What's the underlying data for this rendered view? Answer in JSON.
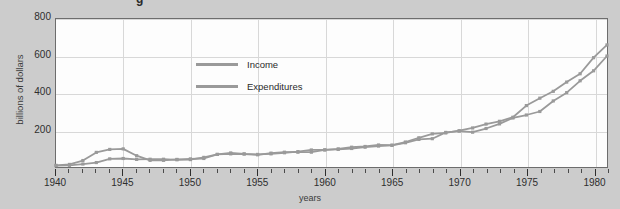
{
  "figure": {
    "title_fragment": "g",
    "background_color": "#cccccc",
    "plot_background_color": "#fdfdfd",
    "frame_color": "#6d6d6d",
    "grid_color": "#d8d8d8",
    "line_color": "#9a9a9a"
  },
  "legend": {
    "position": "inside-top-left",
    "entries": [
      {
        "label": "Income"
      },
      {
        "label": "Expenditures"
      }
    ]
  },
  "chart_data": {
    "type": "line",
    "title": "",
    "xlabel": "years",
    "ylabel": "billions of dollars",
    "xlim": [
      1940,
      1981
    ],
    "ylim": [
      0,
      800
    ],
    "yticks": [
      200,
      400,
      600,
      800
    ],
    "xticks_major": [
      1940,
      1945,
      1950,
      1955,
      1960,
      1965,
      1970,
      1975,
      1980
    ],
    "xtick_interval_minor": 1,
    "grid": true,
    "legend_position": "inside-top-left",
    "x": [
      1940,
      1941,
      1942,
      1943,
      1944,
      1945,
      1946,
      1947,
      1948,
      1949,
      1950,
      1951,
      1952,
      1953,
      1954,
      1955,
      1956,
      1957,
      1958,
      1959,
      1960,
      1961,
      1962,
      1963,
      1964,
      1965,
      1966,
      1967,
      1968,
      1969,
      1970,
      1971,
      1972,
      1973,
      1974,
      1975,
      1976,
      1977,
      1978,
      1979,
      1980,
      1981
    ],
    "series": [
      {
        "name": "Income",
        "values": [
          7,
          9,
          16,
          24,
          44,
          46,
          41,
          42,
          42,
          39,
          40,
          52,
          68,
          71,
          70,
          66,
          75,
          80,
          80,
          80,
          93,
          95,
          100,
          107,
          113,
          117,
          131,
          149,
          153,
          187,
          194,
          188,
          208,
          233,
          265,
          281,
          300,
          357,
          402,
          466,
          520,
          600
        ]
      },
      {
        "name": "Expenditures",
        "values": [
          9,
          14,
          35,
          79,
          95,
          98,
          61,
          36,
          36,
          41,
          44,
          46,
          68,
          76,
          71,
          68,
          71,
          77,
          83,
          92,
          92,
          98,
          107,
          111,
          119,
          118,
          135,
          158,
          179,
          184,
          196,
          211,
          232,
          247,
          269,
          332,
          372,
          409,
          459,
          504,
          591,
          660
        ]
      }
    ],
    "series_endpoints": {
      "Income": 600,
      "Expenditures": 660
    }
  }
}
